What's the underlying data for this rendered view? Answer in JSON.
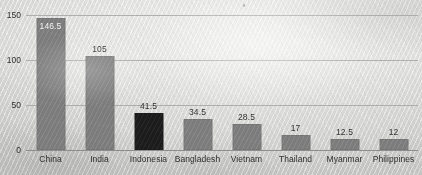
{
  "chart_data": {
    "type": "bar",
    "title": "",
    "subtitle": "",
    "xlabel": "",
    "ylabel": "",
    "categories": [
      "China",
      "India",
      "Indonesia",
      "Bangladesh",
      "Vietnam",
      "Thailand",
      "Myanmar",
      "Philippines"
    ],
    "values": [
      146.5,
      105,
      41.5,
      34.5,
      28.5,
      17,
      12.5,
      12
    ],
    "value_labels": [
      "146.5",
      "105",
      "41.5",
      "34.5",
      "28.5",
      "17",
      "12.5",
      "12"
    ],
    "label_placement": [
      "inside",
      "outside",
      "outside",
      "outside",
      "outside",
      "outside",
      "outside",
      "outside"
    ],
    "highlighted": [
      "Indonesia"
    ],
    "ylim": [
      0,
      150
    ],
    "yticks": [
      0,
      50,
      100,
      150
    ],
    "ytick_labels": [
      "0",
      "50",
      "100",
      "150"
    ],
    "grid": true,
    "grid_axis": "y",
    "legend": "none",
    "colors": {
      "bar": "#7c7c7c",
      "bar_highlight": "#1c1c1c",
      "gridline": "#a6a6a4",
      "axis": "#8d8d8b",
      "background": "#dededc",
      "text": "#2f2f2f",
      "inside_label_text": "#f2f2f2"
    }
  }
}
